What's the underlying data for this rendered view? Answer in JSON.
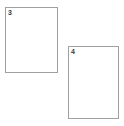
{
  "canvas": {
    "width": 124,
    "height": 126,
    "background_color": "#ffffff"
  },
  "style": {
    "panel_border_color": "#a0a0a0",
    "panel_fill_color": "#ffffff",
    "label_color": "#3a3a3a"
  },
  "panels": [
    {
      "label": "3",
      "x": 5,
      "y": 7,
      "width": 53,
      "height": 66
    },
    {
      "label": "4",
      "x": 68,
      "y": 46,
      "width": 51,
      "height": 73
    }
  ]
}
